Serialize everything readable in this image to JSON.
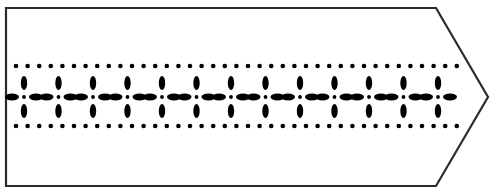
{
  "canvas": {
    "width": 493,
    "height": 196,
    "background_color": "#ffffff"
  },
  "banner": {
    "name": "decorative-arrow-banner",
    "description": "Right-pointing ribbon banner with a dotted and floral border ornament",
    "fill_color": "#ffffff",
    "stroke_color": "#2b2b2b",
    "stroke_width": 2.2,
    "outline_points": [
      [
        6,
        8
      ],
      [
        436,
        8
      ],
      [
        488,
        97
      ],
      [
        436,
        186
      ],
      [
        6,
        186
      ]
    ],
    "body": {
      "left": 6,
      "top": 8,
      "right": 436,
      "bottom": 186
    },
    "point": {
      "tip_x": 488,
      "tip_y": 97,
      "notch_top_x": 436,
      "notch_bottom_x": 436
    }
  },
  "ornament": {
    "color": "#000000",
    "rows": [
      {
        "name": "top-dot-row",
        "type": "dots",
        "center_y": 66,
        "start_x": 16,
        "end_x": 470,
        "spacing": 11.6,
        "dot_radius": 2.3,
        "count": 40
      },
      {
        "name": "middle-flower-row",
        "type": "flowers",
        "center_y": 97,
        "start_x": 24,
        "end_x": 472,
        "spacing": 34.5,
        "count": 14,
        "flower": {
          "center_dot_radius": 1.9,
          "vertical_petal_rx": 3.2,
          "vertical_petal_ry": 7.0,
          "vertical_petal_offset": 14,
          "horizontal_petal_rx": 7.0,
          "horizontal_petal_ry": 3.4,
          "horizontal_petal_offset": 12
        },
        "separator_dot_radius": 1.9
      },
      {
        "name": "bottom-dot-row",
        "type": "dots",
        "center_y": 126,
        "start_x": 16,
        "end_x": 470,
        "spacing": 11.6,
        "dot_radius": 2.3,
        "count": 40
      }
    ]
  }
}
